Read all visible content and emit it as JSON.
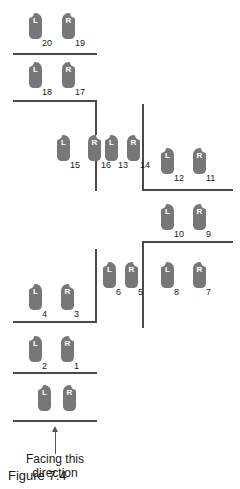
{
  "figure": {
    "label": "Figure 7.4",
    "direction_caption_line1": "Facing this",
    "direction_caption_line2": "direction",
    "arrow_icon": "up-arrow-icon",
    "foot_color": "#77777a",
    "wall_color": "#4a4a4a",
    "text_color": "#1a1a1a",
    "background": "#ffffff"
  },
  "footprints": [
    {
      "label": "L",
      "number": "20",
      "side": "left",
      "x": 29,
      "y": 13
    },
    {
      "label": "R",
      "number": "19",
      "side": "right",
      "x": 62,
      "y": 13
    },
    {
      "label": "L",
      "number": "18",
      "side": "left",
      "x": 29,
      "y": 62
    },
    {
      "label": "R",
      "number": "17",
      "side": "right",
      "x": 62,
      "y": 62
    },
    {
      "label": "L",
      "number": "15",
      "side": "left",
      "x": 57,
      "y": 135
    },
    {
      "label": "R",
      "number": "16",
      "side": "right",
      "x": 88,
      "y": 135
    },
    {
      "label": "L",
      "number": "13",
      "side": "left",
      "x": 105,
      "y": 135
    },
    {
      "label": "R",
      "number": "14",
      "side": "right",
      "x": 127,
      "y": 135
    },
    {
      "label": "L",
      "number": "12",
      "side": "left",
      "x": 161,
      "y": 148
    },
    {
      "label": "R",
      "number": "11",
      "side": "right",
      "x": 193,
      "y": 148
    },
    {
      "label": "L",
      "number": "10",
      "side": "left",
      "x": 161,
      "y": 204
    },
    {
      "label": "R",
      "number": "9",
      "side": "right",
      "x": 193,
      "y": 204
    },
    {
      "label": "L",
      "number": "8",
      "side": "left",
      "x": 161,
      "y": 262
    },
    {
      "label": "R",
      "number": "7",
      "side": "right",
      "x": 193,
      "y": 262
    },
    {
      "label": "L",
      "number": "6",
      "side": "left",
      "x": 103,
      "y": 262
    },
    {
      "label": "R",
      "number": "5",
      "side": "right",
      "x": 125,
      "y": 262
    },
    {
      "label": "L",
      "number": "4",
      "side": "left",
      "x": 29,
      "y": 284
    },
    {
      "label": "R",
      "number": "3",
      "side": "right",
      "x": 61,
      "y": 284
    },
    {
      "label": "L",
      "number": "2",
      "side": "left",
      "x": 29,
      "y": 336
    },
    {
      "label": "R",
      "number": "1",
      "side": "right",
      "x": 61,
      "y": 336
    },
    {
      "label": "L",
      "number": "",
      "side": "left",
      "x": 38,
      "y": 385
    },
    {
      "label": "R",
      "number": "",
      "side": "right",
      "x": 63,
      "y": 385
    }
  ],
  "walls": [
    {
      "name": "wall-top-1",
      "x": 13,
      "y": 53,
      "w": 84,
      "h": 2
    },
    {
      "name": "wall-top-2",
      "x": 13,
      "y": 100,
      "w": 84,
      "h": 2
    },
    {
      "name": "wall-vertical-left",
      "x": 95,
      "y": 100,
      "w": 2,
      "h": 91
    },
    {
      "name": "wall-vertical-mid",
      "x": 142,
      "y": 104,
      "w": 2,
      "h": 87
    },
    {
      "name": "wall-right-upper",
      "x": 142,
      "y": 189,
      "w": 91,
      "h": 2
    },
    {
      "name": "wall-right-lower",
      "x": 142,
      "y": 241,
      "w": 91,
      "h": 2
    },
    {
      "name": "wall-vertical-right",
      "x": 142,
      "y": 241,
      "w": 2,
      "h": 87
    },
    {
      "name": "wall-vertical-mid-2",
      "x": 95,
      "y": 249,
      "w": 2,
      "h": 74
    },
    {
      "name": "wall-bottom-1",
      "x": 13,
      "y": 321,
      "w": 84,
      "h": 2
    },
    {
      "name": "wall-bottom-2",
      "x": 13,
      "y": 372,
      "w": 84,
      "h": 2
    },
    {
      "name": "wall-bottom-3",
      "x": 13,
      "y": 420,
      "w": 84,
      "h": 2
    }
  ],
  "arrow": {
    "x": 52,
    "y": 426
  },
  "direction_caption": {
    "x": 12,
    "y": 452
  }
}
